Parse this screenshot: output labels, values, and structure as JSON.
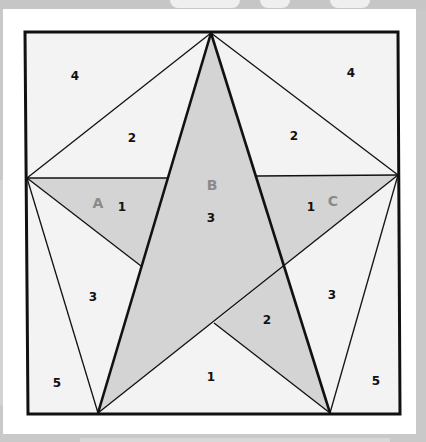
{
  "diagram": {
    "title": "",
    "colors": {
      "background": "#c9c9c9",
      "paper": "#ffffff",
      "light_fill": "#f3f3f3",
      "star_fill": "#d4d4d4",
      "line": "#111111",
      "piece_letter": "#8a8a8a",
      "number": "#111111"
    },
    "pieces": {
      "A": {
        "letter": "A",
        "number": "1"
      },
      "B": {
        "letter": "B",
        "number": "3"
      },
      "C": {
        "letter": "C",
        "number": "1"
      }
    },
    "region_numbers": {
      "top_left_corner": "4",
      "top_right_corner": "4",
      "top_left_triangle": "2",
      "top_right_triangle": "2",
      "left_side_triangle": "3",
      "right_side_triangle": "3",
      "bottom_left_corner": "5",
      "bottom_right_corner": "5",
      "bottom_center_triangle": "1",
      "lower_right_star_point": "2"
    }
  }
}
